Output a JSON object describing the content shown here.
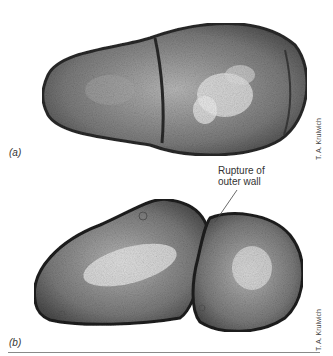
{
  "figure": {
    "panels": [
      {
        "label": "(a)",
        "credit": "T. A. Krulwich",
        "description": "Electron micrograph of dividing bacterial cell with septum"
      },
      {
        "label": "(b)",
        "credit": "T. A. Krulwich",
        "description": "Electron micrograph of two cells with ruptured outer wall"
      }
    ],
    "annotation": {
      "line1": "Rupture of",
      "line2": "outer wall"
    }
  }
}
